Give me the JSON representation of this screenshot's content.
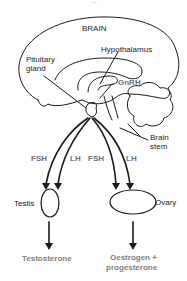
{
  "diagram": {
    "header_fragment": "...",
    "labels": {
      "brain": "BRAIN",
      "pituitary": "Pituitary\ngland",
      "pituitary_line1": "Pituitary",
      "pituitary_line2": "gland",
      "hypothalamus": "Hypothalamus",
      "gnrh": "GnRH",
      "brain_stem_line1": "Brain",
      "brain_stem_line2": "stem",
      "testis": "Testis",
      "ovary": "Ovary"
    },
    "hormones": {
      "fsh_left": "FSH",
      "lh_left": "LH",
      "fsh_right": "FSH",
      "lh_right": "LH"
    },
    "products": {
      "testosterone": "Testosterone",
      "oestrogen_line1": "Oestrogen +",
      "oestrogen_line2": "progesterone"
    },
    "colors": {
      "line": "#1a1a1a",
      "hormone_label": "#707070",
      "product_label": "#808080"
    }
  }
}
